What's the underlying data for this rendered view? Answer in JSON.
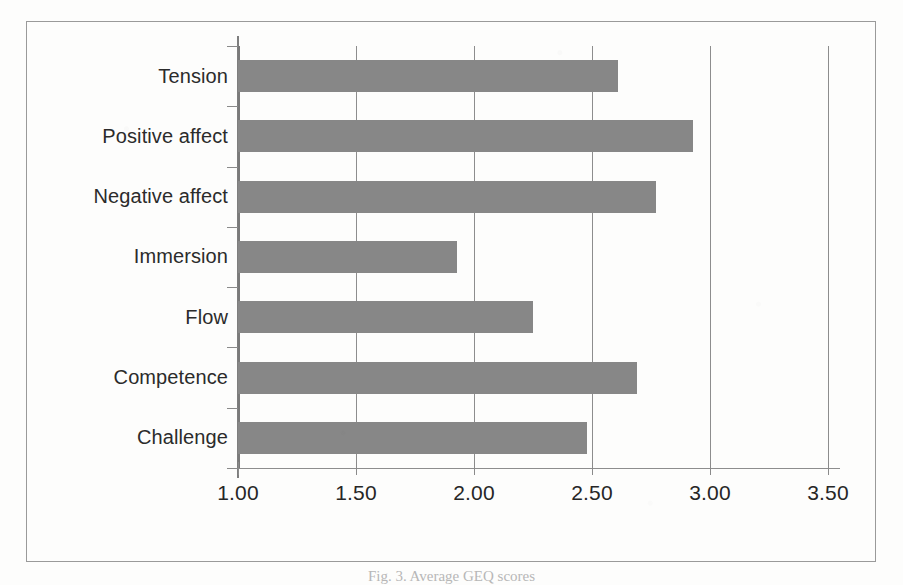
{
  "chart_data": {
    "type": "bar",
    "orientation": "horizontal",
    "title": "",
    "subtitle": "",
    "xlabel": "",
    "ylabel": "",
    "categories": [
      "Challenge",
      "Competence",
      "Flow",
      "Immersion",
      "Negative affect",
      "Positive affect",
      "Tension"
    ],
    "values": [
      2.48,
      2.69,
      2.25,
      1.93,
      2.77,
      2.93,
      2.61
    ],
    "series": [
      {
        "name": "Mean score",
        "values": [
          2.48,
          2.69,
          2.25,
          1.93,
          2.77,
          2.93,
          2.61
        ]
      }
    ],
    "display_order_top_to_bottom": [
      "Tension",
      "Positive affect",
      "Negative affect",
      "Immersion",
      "Flow",
      "Competence",
      "Challenge"
    ],
    "xlim": [
      1.0,
      3.5
    ],
    "xticks": [
      1.0,
      1.5,
      2.0,
      2.5,
      3.0,
      3.5
    ],
    "xtick_labels": [
      "1.00",
      "1.50",
      "2.00",
      "2.50",
      "3.00",
      "3.50"
    ],
    "grid": "vertical",
    "legend": "none",
    "bar_color": "#878787",
    "axis_color": "#8a8a8a",
    "text_color": "#2b2b2b"
  },
  "caption": {
    "text": "Fig. 3.  Average GEQ scores"
  }
}
